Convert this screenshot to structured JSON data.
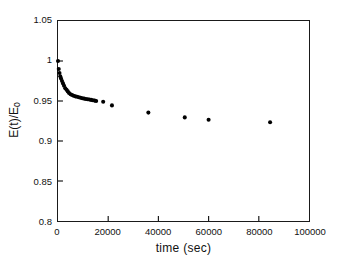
{
  "chart_data": {
    "type": "scatter",
    "title": "",
    "xlabel": "time (sec)",
    "ylabel": "E(t)/E0",
    "ylabel_base": "E(t)/E",
    "ylabel_sub": "0",
    "xlim": [
      0,
      100000
    ],
    "ylim": [
      0.8,
      1.05
    ],
    "xticks": [
      0,
      20000,
      40000,
      60000,
      80000,
      100000
    ],
    "xtick_labels": [
      "0",
      "20000",
      "40000",
      "60000",
      "80000",
      "100000"
    ],
    "yticks": [
      0.8,
      0.85,
      0.9,
      0.95,
      1.0,
      1.05
    ],
    "ytick_labels": [
      "0.8",
      "0.85",
      "0.9",
      "0.95",
      "1",
      "1.05"
    ],
    "grid": false,
    "legend": false,
    "marker": "filled-circle",
    "marker_color": "#000000",
    "marker_size_px": 3.6,
    "series": [
      {
        "name": "E(t)/E0",
        "x": [
          0,
          300,
          600,
          900,
          1200,
          1600,
          2000,
          2400,
          2900,
          3400,
          3900,
          4400,
          5000,
          5600,
          6200,
          6900,
          7600,
          8300,
          9000,
          9700,
          10400,
          11100,
          11800,
          12500,
          13200,
          13900,
          14600,
          15200,
          18000,
          21500,
          36000,
          50500,
          60000,
          84500
        ],
        "y": [
          1.0,
          0.99,
          0.985,
          0.981,
          0.978,
          0.975,
          0.972,
          0.969,
          0.966,
          0.964,
          0.962,
          0.96,
          0.9585,
          0.9575,
          0.9565,
          0.9558,
          0.9552,
          0.9546,
          0.954,
          0.9535,
          0.953,
          0.9526,
          0.9522,
          0.9518,
          0.9514,
          0.951,
          0.9505,
          0.95,
          0.949,
          0.9445,
          0.9355,
          0.9295,
          0.9265,
          0.9235
        ]
      }
    ]
  }
}
